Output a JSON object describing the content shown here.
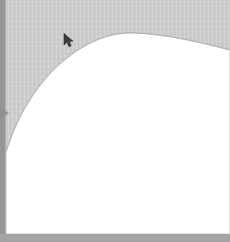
{
  "window": {
    "width": 230,
    "height": 242,
    "title": "Canvas"
  },
  "colors": {
    "canvas_gray": "#c9c9c9",
    "gutter_gray": "#979797",
    "bottom_band_gray": "#a5a5a5",
    "surface_white": "#ffffff",
    "edge_line": "#b5b5b5",
    "cursor_dark": "#3c3c3c"
  },
  "canvas": {
    "backdrop_name": "canvas-backdrop",
    "backdrop_label": "Gray canvas backdrop"
  },
  "left_gutter": {
    "label": "Left gutter",
    "width_px": 6,
    "marker_label": "Gutter position marker"
  },
  "bottom_band": {
    "label": "Bottom status band",
    "height_px": 8
  },
  "content_surface": {
    "label": "White content surface",
    "shape": "rounded-corner sheet with convex arc edge",
    "arc_peak_x": 135,
    "arc_peak_y": 33,
    "arc_left_x": 6,
    "arc_left_y": 152,
    "arc_right_x": 230,
    "arc_right_y": 50
  },
  "cursor": {
    "label": "Mouse pointer",
    "x": 68,
    "y": 38
  }
}
